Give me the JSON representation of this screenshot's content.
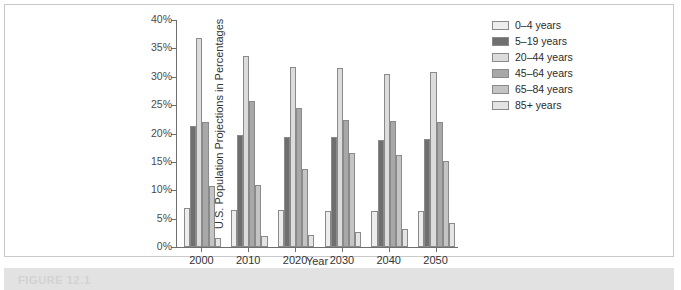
{
  "figure": {
    "caption": "FIGURE 12.1"
  },
  "chart_data": {
    "type": "bar",
    "title": "",
    "subtitle": "",
    "xlabel": "Year",
    "ylabel": "U.S. Population Projections in Percentages",
    "categories": [
      "2000",
      "2010",
      "2020",
      "2030",
      "2040",
      "2050"
    ],
    "ylim": [
      0,
      40
    ],
    "ytick_values": [
      0,
      5,
      10,
      15,
      20,
      25,
      30,
      35,
      40
    ],
    "ytick_labels": [
      "0%",
      "5%",
      "10%",
      "15%",
      "20%",
      "25%",
      "30%",
      "35%",
      "40%"
    ],
    "grid": false,
    "legend_position": "right",
    "series": [
      {
        "name": "0–4 years",
        "color": "#ededed",
        "values": [
          6.8,
          6.6,
          6.5,
          6.4,
          6.4,
          6.3
        ]
      },
      {
        "name": "5–19 years",
        "color": "#6f6f6f",
        "values": [
          21.4,
          19.8,
          19.3,
          19.3,
          18.8,
          19.0
        ]
      },
      {
        "name": "20–44 years",
        "color": "#dcdcdc",
        "values": [
          36.8,
          33.6,
          31.8,
          31.5,
          30.5,
          30.8
        ]
      },
      {
        "name": "45–64 years",
        "color": "#a8a8a8",
        "values": [
          22.1,
          25.7,
          24.5,
          22.3,
          22.2,
          22.1
        ]
      },
      {
        "name": "65–84 years",
        "color": "#c4c4c4",
        "values": [
          10.7,
          10.9,
          13.8,
          16.5,
          16.2,
          15.2
        ]
      },
      {
        "name": "85+ years",
        "color": "#e4e4e4",
        "values": [
          1.6,
          2.0,
          2.2,
          2.6,
          3.1,
          4.3
        ]
      }
    ]
  }
}
